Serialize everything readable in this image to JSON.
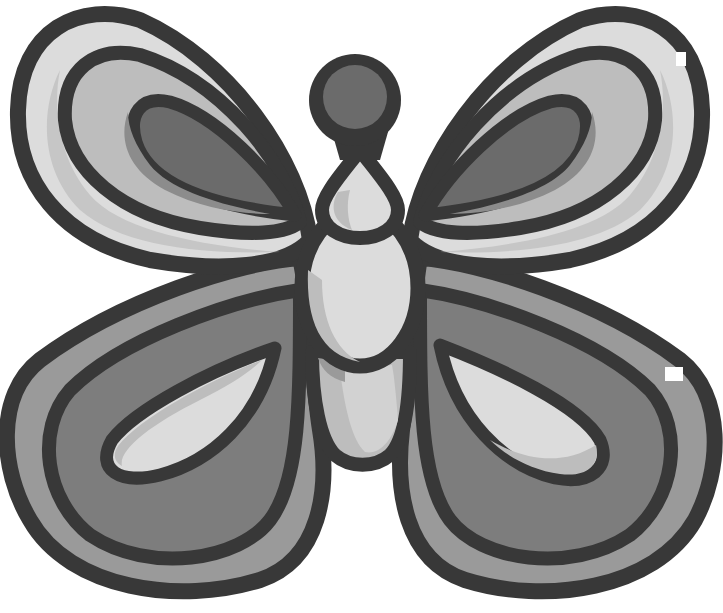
{
  "image": {
    "subject": "Cartoon butterfly illustration",
    "style": "grayscale flat vector with thick dark outlines",
    "palette": {
      "background": "#ffffff",
      "outline": "#383838",
      "light": "#dcdcdc",
      "light_shadow": "#bdbdbd",
      "mid": "#9a9a9a",
      "mid_dark": "#7d7d7d",
      "dark": "#6b6b6b"
    },
    "parts": [
      "head",
      "thorax",
      "abdomen",
      "tail",
      "upper-left-wing",
      "upper-right-wing",
      "lower-left-wing",
      "lower-right-wing"
    ]
  }
}
